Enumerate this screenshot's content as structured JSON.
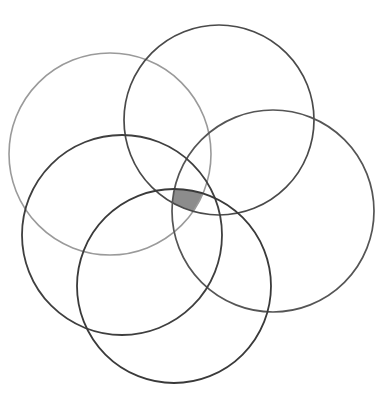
{
  "figure": {
    "title": "",
    "caption": "",
    "background_color": "#ffffff",
    "width": 392,
    "height": 399,
    "type": "overlapping-circles-rosette",
    "shape_count": 5,
    "shaded_region_count": 1,
    "labels": []
  },
  "chart_data": {
    "type": "diagram",
    "subtype": "venn-rosette",
    "title": "",
    "xlabel": "",
    "ylabel": "",
    "grid": false,
    "legend": null,
    "annotations": [],
    "canvas": {
      "width": 392,
      "height": 399,
      "background": "#ffffff"
    },
    "circles": [
      {
        "id": "circle-upper-left",
        "name": "upper-left-circle",
        "cx": 110,
        "cy": 154,
        "r": 101,
        "stroke": "#9a9a9a",
        "stroke_width": 1.6,
        "fill": "none"
      },
      {
        "id": "circle-top",
        "name": "top-circle",
        "cx": 219,
        "cy": 120,
        "r": 95,
        "stroke": "#4a4a4a",
        "stroke_width": 1.7,
        "fill": "none"
      },
      {
        "id": "circle-right",
        "name": "right-circle",
        "cx": 273,
        "cy": 211,
        "r": 101,
        "stroke": "#555555",
        "stroke_width": 1.7,
        "fill": "none"
      },
      {
        "id": "circle-lower-left",
        "name": "lower-left-circle",
        "cx": 122,
        "cy": 235,
        "r": 100,
        "stroke": "#3f3f3f",
        "stroke_width": 1.8,
        "fill": "none"
      },
      {
        "id": "circle-bottom",
        "name": "bottom-circle",
        "cx": 174,
        "cy": 286,
        "r": 97,
        "stroke": "#3a3a3a",
        "stroke_width": 1.8,
        "fill": "none"
      }
    ],
    "shaded_regions": [
      {
        "id": "central-intersection",
        "name": "central-shaded-intersection",
        "fill": "#8c8c8c",
        "opacity": 1,
        "approx_bbox": {
          "x": 167,
          "y": 172,
          "width": 46,
          "height": 47
        },
        "description": "common intersection of all five circles"
      }
    ]
  }
}
